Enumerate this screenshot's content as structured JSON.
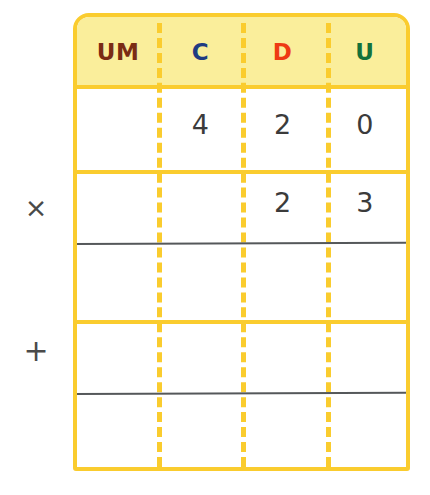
{
  "worksheet": {
    "title": "Place value multiplication grid",
    "operators": {
      "multiply": "×",
      "add": "+"
    },
    "colors": {
      "frame": "#FACC2E",
      "header_background": "#FAEE9B",
      "rule": "#55585A",
      "um": "#7A2C14",
      "c": "#1F3C82",
      "d": "#EE3A13",
      "u": "#14713A",
      "digit": "#3B3B3B",
      "page_background": "#FFFFFF"
    },
    "table": {
      "headers": [
        {
          "label": "UM",
          "name": "unidad-de-millar"
        },
        {
          "label": "C",
          "name": "centenas"
        },
        {
          "label": "D",
          "name": "decenas"
        },
        {
          "label": "U",
          "name": "unidades"
        }
      ],
      "rows": [
        {
          "name": "multiplicand-row",
          "operator": "",
          "cells": [
            "",
            "4",
            "2",
            "0"
          ],
          "rule_below": false
        },
        {
          "name": "multiplier-row",
          "operator": "×",
          "cells": [
            "",
            "",
            "2",
            "3"
          ],
          "rule_below": true
        },
        {
          "name": "partial-product-row",
          "operator": "",
          "cells": [
            "",
            "",
            "",
            ""
          ],
          "rule_below": false
        },
        {
          "name": "second-partial-product-row",
          "operator": "+",
          "cells": [
            "",
            "",
            "",
            ""
          ],
          "rule_below": true
        },
        {
          "name": "total-row",
          "operator": "",
          "cells": [
            "",
            "",
            "",
            ""
          ],
          "rule_below": false
        }
      ]
    }
  }
}
